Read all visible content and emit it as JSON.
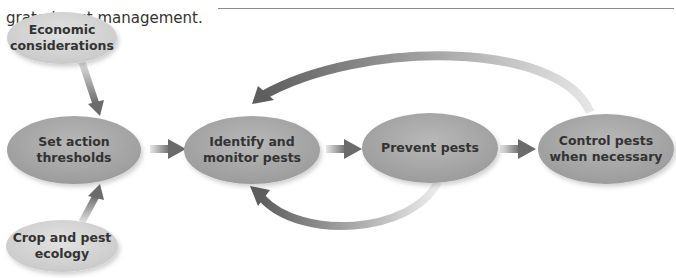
{
  "caption": {
    "line_partial": "...",
    "line2": "grated pest management."
  },
  "diagram": {
    "inputs": [
      {
        "id": "economic",
        "label_lines": [
          "Economic",
          "considerations"
        ]
      },
      {
        "id": "crop",
        "label_lines": [
          "Crop and pest",
          "ecology"
        ]
      }
    ],
    "steps": [
      {
        "id": "thresholds",
        "label_lines": [
          "Set action",
          "thresholds"
        ]
      },
      {
        "id": "identify",
        "label_lines": [
          "Identify and",
          "monitor pests"
        ]
      },
      {
        "id": "prevent",
        "label_lines": [
          "Prevent pests"
        ]
      },
      {
        "id": "control",
        "label_lines": [
          "Control pests",
          "when necessary"
        ]
      }
    ],
    "colors": {
      "step_fill": "#a9a9a9",
      "input_fill": "#d6d6d6",
      "arrow": "#6b6b6b",
      "text": "#333333"
    }
  }
}
